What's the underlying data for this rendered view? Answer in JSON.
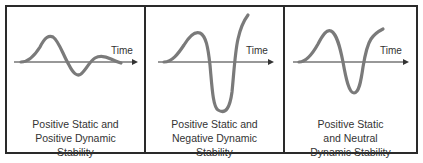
{
  "diagram": {
    "panels": [
      {
        "id": "positive-dynamic",
        "axis_label": "Time",
        "caption": [
          "Positive Static and",
          "Positive Dynamic",
          "Stability"
        ]
      },
      {
        "id": "negative-dynamic",
        "axis_label": "Time",
        "caption": [
          "Positive Static and",
          "Negative Dynamic",
          "Stability"
        ]
      },
      {
        "id": "neutral-dynamic",
        "axis_label": "Time",
        "caption": [
          "Positive Static",
          "and Neutral",
          "Dynamic Stability"
        ]
      }
    ],
    "colors": {
      "border": "#2a2a2a",
      "axis": "#333333",
      "curve": "#7a7a7a",
      "text": "#333333"
    }
  }
}
